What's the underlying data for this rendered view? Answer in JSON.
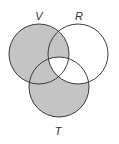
{
  "diagram": {
    "type": "venn",
    "sets": [
      {
        "id": "V",
        "label": "V",
        "cx": 39,
        "cy": 54,
        "r": 30,
        "label_x": 39,
        "label_y": 20
      },
      {
        "id": "R",
        "label": "R",
        "cx": 78,
        "cy": 54,
        "r": 30,
        "label_x": 79,
        "label_y": 20
      },
      {
        "id": "T",
        "label": "T",
        "cx": 59,
        "cy": 87,
        "r": 30,
        "label_x": 58,
        "label_y": 135
      }
    ],
    "shaded_regions": [
      "V only",
      "V∩R only",
      "V∩T only",
      "T only"
    ],
    "unshaded_regions": [
      "R only",
      "R∩T only",
      "V∩R∩T"
    ],
    "colors": {
      "shade": "#c4c4c4",
      "stroke": "#3a3a3a",
      "background": "#ffffff"
    }
  }
}
